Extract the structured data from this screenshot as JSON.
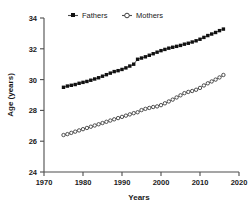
{
  "chart_data": {
    "type": "scatter",
    "title": "",
    "xlabel": "Years",
    "ylabel": "Age (years)",
    "xlim": [
      1970,
      2020
    ],
    "ylim": [
      24,
      34
    ],
    "xticks": [
      1970,
      1980,
      1990,
      2000,
      2010,
      2020
    ],
    "yticks": [
      24,
      26,
      28,
      30,
      32,
      34
    ],
    "grid": false,
    "legend_position": "top-center",
    "x": [
      1975,
      1976,
      1977,
      1978,
      1979,
      1980,
      1981,
      1982,
      1983,
      1984,
      1985,
      1986,
      1987,
      1988,
      1989,
      1990,
      1991,
      1992,
      1993,
      1994,
      1995,
      1996,
      1997,
      1998,
      1999,
      2000,
      2001,
      2002,
      2003,
      2004,
      2005,
      2006,
      2007,
      2008,
      2009,
      2010,
      2011,
      2012,
      2013,
      2014,
      2015,
      2016
    ],
    "series": [
      {
        "name": "Fathers",
        "marker": "filled-square",
        "color": "#111111",
        "values": [
          29.5,
          29.58,
          29.63,
          29.68,
          29.76,
          29.82,
          29.88,
          29.96,
          30.04,
          30.12,
          30.22,
          30.32,
          30.42,
          30.52,
          30.58,
          30.66,
          30.76,
          30.88,
          31.0,
          31.32,
          31.4,
          31.48,
          31.58,
          31.68,
          31.78,
          31.88,
          31.96,
          32.04,
          32.1,
          32.16,
          32.22,
          32.3,
          32.36,
          32.44,
          32.52,
          32.62,
          32.74,
          32.86,
          32.96,
          33.06,
          33.18,
          33.28
        ]
      },
      {
        "name": "Mothers",
        "marker": "open-circle",
        "color": "#3d3d3d",
        "values": [
          26.4,
          26.46,
          26.54,
          26.62,
          26.7,
          26.78,
          26.86,
          26.94,
          27.02,
          27.1,
          27.18,
          27.26,
          27.34,
          27.42,
          27.5,
          27.58,
          27.66,
          27.74,
          27.82,
          27.88,
          28.02,
          28.1,
          28.16,
          28.22,
          28.26,
          28.34,
          28.46,
          28.58,
          28.7,
          28.84,
          28.98,
          29.12,
          29.2,
          29.26,
          29.34,
          29.46,
          29.62,
          29.76,
          29.88,
          30.0,
          30.14,
          30.3
        ]
      }
    ],
    "legend": [
      "Fathers",
      "Mothers"
    ]
  },
  "axis": {
    "y_title": "Age (years)",
    "x_title": "Years",
    "y_tick_labels": [
      "34",
      "32",
      "30",
      "28",
      "26",
      "24"
    ],
    "x_tick_labels": [
      "1970",
      "1980",
      "1990",
      "2000",
      "2010",
      "2020"
    ]
  },
  "legend": {
    "items": [
      {
        "label": "Fathers",
        "marker": "filled-square-marker"
      },
      {
        "label": "Mothers",
        "marker": "open-circle-marker"
      }
    ]
  }
}
